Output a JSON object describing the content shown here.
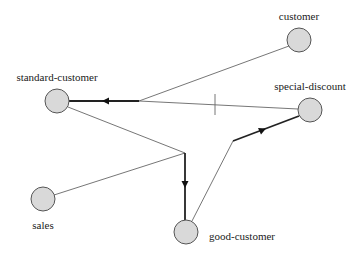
{
  "diagram": {
    "type": "hyperedge-graph",
    "nodes": [
      {
        "id": "customer",
        "label": "customer",
        "x": 299,
        "y": 40,
        "label_x": 299,
        "label_y": 20,
        "anchor": "middle"
      },
      {
        "id": "standard-customer",
        "label": "standard-customer",
        "x": 57,
        "y": 101,
        "label_x": 57,
        "label_y": 81,
        "anchor": "middle"
      },
      {
        "id": "special-discount",
        "label": "special-discount",
        "x": 310,
        "y": 110,
        "label_x": 310,
        "label_y": 90,
        "anchor": "middle"
      },
      {
        "id": "sales",
        "label": "sales",
        "x": 43,
        "y": 199,
        "label_x": 43,
        "label_y": 229,
        "anchor": "middle"
      },
      {
        "id": "good-customer",
        "label": "good-customer",
        "x": 186,
        "y": 232,
        "label_x": 209,
        "label_y": 240,
        "anchor": "start"
      }
    ],
    "edges": [
      {
        "id": "e1",
        "sources": [
          "customer",
          "special-discount"
        ],
        "target": "standard-customer",
        "junction": [
          139,
          101
        ],
        "marker": "tick"
      },
      {
        "id": "e2",
        "sources": [
          "standard-customer",
          "sales"
        ],
        "target": "good-customer",
        "junction": [
          185,
          153
        ]
      },
      {
        "id": "e3",
        "sources": [
          "good-customer"
        ],
        "target": "special-discount",
        "junction": [
          233,
          141
        ]
      }
    ]
  }
}
